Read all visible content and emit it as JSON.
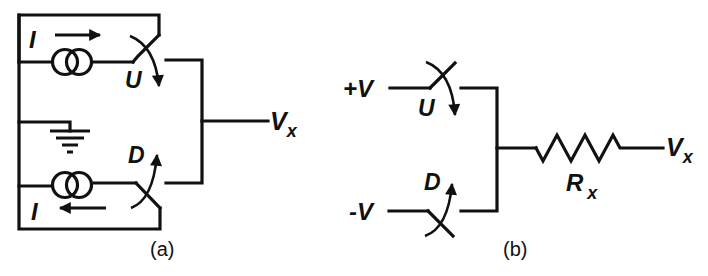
{
  "figure": {
    "panel_a": {
      "caption": "(a)",
      "labels": {
        "current_top": "I",
        "current_bottom": "I",
        "switch_up": "U",
        "switch_down": "D",
        "output": "V",
        "output_sub": "x"
      },
      "components": [
        "current-source-top",
        "current-source-bottom",
        "switch-up",
        "switch-down",
        "ground"
      ]
    },
    "panel_b": {
      "caption": "(b)",
      "labels": {
        "pos_supply": "+V",
        "neg_supply": "-V",
        "switch_up": "U",
        "switch_down": "D",
        "resistor": "R",
        "resistor_sub": "x",
        "output": "V",
        "output_sub": "x"
      },
      "components": [
        "switch-up",
        "switch-down",
        "resistor"
      ]
    },
    "colors": {
      "ink": "#111111",
      "background": "#ffffff"
    }
  }
}
